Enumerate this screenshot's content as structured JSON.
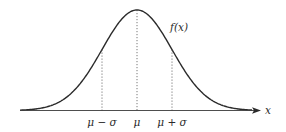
{
  "diagram": {
    "curve_label": "f(x)",
    "axis_label": "x",
    "ticks": [
      {
        "label": "μ − σ",
        "pos": 102
      },
      {
        "label": "μ",
        "pos": 137
      },
      {
        "label": "μ + σ",
        "pos": 172
      }
    ],
    "colors": {
      "curve": "#2b2b2b",
      "axis": "#3a3a3a",
      "guides": "#555555",
      "background": "#ffffff"
    }
  },
  "chart_data": {
    "type": "line",
    "title": "",
    "xlabel": "x",
    "ylabel": "f(x)",
    "series": [
      {
        "name": "f(x)",
        "description": "Gaussian bell curve centered at μ with standard deviation σ"
      }
    ],
    "annotations": [
      "μ − σ",
      "μ",
      "μ + σ"
    ],
    "grid": false
  }
}
